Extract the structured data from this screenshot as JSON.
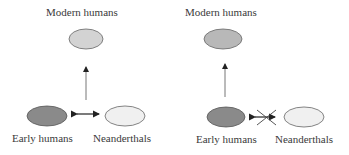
{
  "panels": [
    {
      "id": "left",
      "nodes": {
        "modern": {
          "label": "Modern humans",
          "fill": "#d3d3d3"
        },
        "early": {
          "label": "Early humans",
          "fill": "#8a8a8a"
        },
        "neanderthal": {
          "label": "Neanderthals",
          "fill": "#f0f0f0"
        }
      },
      "edges": [
        {
          "from": "early",
          "to": "modern",
          "type": "arrow"
        },
        {
          "from": "early",
          "to": "neanderthal",
          "type": "bidirectional"
        }
      ]
    },
    {
      "id": "right",
      "nodes": {
        "modern": {
          "label": "Modern humans",
          "fill": "#b8b8b8"
        },
        "early": {
          "label": "Early humans",
          "fill": "#8a8a8a"
        },
        "neanderthal": {
          "label": "Neanderthals",
          "fill": "#f0f0f0"
        }
      },
      "edges": [
        {
          "from": "early",
          "to": "modern",
          "type": "arrow"
        },
        {
          "from": "early",
          "to": "neanderthal",
          "type": "bidirectional-crossed-out"
        }
      ]
    }
  ],
  "colors": {
    "stroke": "#555555",
    "arrow": "#222222",
    "line": "#777777"
  }
}
